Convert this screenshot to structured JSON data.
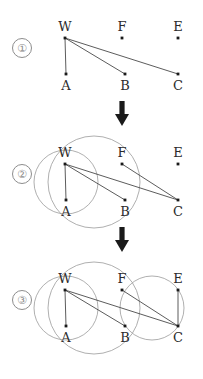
{
  "figure": {
    "title": "",
    "canvas": {
      "width": 203,
      "height": 379
    },
    "panel_height": 126,
    "arrow_symbol": "down-arrow"
  },
  "nodes": [
    {
      "id": "W",
      "label": "W",
      "x": 65,
      "y": 38,
      "label_x": 65,
      "label_y": 31
    },
    {
      "id": "F",
      "label": "F",
      "x": 122,
      "y": 38,
      "label_x": 122,
      "label_y": 31
    },
    {
      "id": "E",
      "label": "E",
      "x": 178,
      "y": 38,
      "label_x": 178,
      "label_y": 31
    },
    {
      "id": "A",
      "label": "A",
      "x": 66,
      "y": 74,
      "label_x": 66,
      "label_y": 90
    },
    {
      "id": "B",
      "label": "B",
      "x": 125,
      "y": 74,
      "label_x": 125,
      "label_y": 90
    },
    {
      "id": "C",
      "label": "C",
      "x": 178,
      "y": 74,
      "label_x": 178,
      "label_y": 90
    }
  ],
  "panels": [
    {
      "step": "1",
      "badge_label": "①",
      "badge_x": 12,
      "badge_y": 38,
      "edges": [
        {
          "from": "W",
          "to": "A"
        },
        {
          "from": "W",
          "to": "B"
        },
        {
          "from": "W",
          "to": "C"
        }
      ],
      "circles": []
    },
    {
      "step": "2",
      "badge_label": "②",
      "badge_x": 12,
      "badge_y": 38,
      "edges": [
        {
          "from": "W",
          "to": "A"
        },
        {
          "from": "W",
          "to": "B"
        },
        {
          "from": "W",
          "to": "C"
        },
        {
          "from": "F",
          "to": "C"
        }
      ],
      "circles": [
        {
          "name": "circle-wa",
          "cx": 66,
          "cy": 56,
          "r": 32
        },
        {
          "name": "circle-wfb",
          "cx": 94,
          "cy": 56,
          "r": 46
        }
      ]
    },
    {
      "step": "3",
      "badge_label": "③",
      "badge_x": 12,
      "badge_y": 38,
      "edges": [
        {
          "from": "W",
          "to": "A"
        },
        {
          "from": "W",
          "to": "B"
        },
        {
          "from": "W",
          "to": "C"
        },
        {
          "from": "F",
          "to": "C"
        },
        {
          "from": "E",
          "to": "C"
        }
      ],
      "circles": [
        {
          "name": "circle-wa",
          "cx": 66,
          "cy": 56,
          "r": 32
        },
        {
          "name": "circle-wfb",
          "cx": 94,
          "cy": 56,
          "r": 46
        },
        {
          "name": "circle-ec",
          "cx": 152,
          "cy": 56,
          "r": 32
        }
      ]
    }
  ],
  "arrows": [
    {
      "name": "arrow-1-to-2",
      "x": 122,
      "top": 99
    },
    {
      "name": "arrow-2-to-3",
      "x": 122,
      "top": 225
    }
  ],
  "style": {
    "edge_color": "#4a4a4a",
    "circle_color": "#9a9a9a",
    "node_color": "#1a1a1a",
    "label_color": "#2b2b2b",
    "arrow_color": "#1a1a1a",
    "badge_color": "#8d8d8d",
    "background": "#ffffff"
  }
}
